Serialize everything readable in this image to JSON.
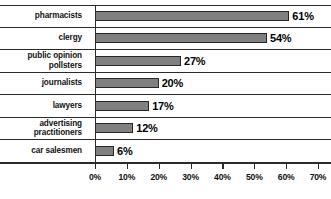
{
  "chart_data": {
    "type": "bar",
    "orientation": "horizontal",
    "title": "",
    "subtitle": "",
    "xlabel": "",
    "ylabel": "",
    "xlim": [
      0,
      70
    ],
    "xtick_labels": [
      "0%",
      "10%",
      "20%",
      "30%",
      "40%",
      "50%",
      "60%",
      "70%"
    ],
    "xticks": [
      0,
      10,
      20,
      30,
      40,
      50,
      60,
      70
    ],
    "grid": false,
    "legend": null,
    "categories": [
      "pharmacists",
      "clergy",
      "public opinion pollsters",
      "journalists",
      "lawyers",
      "advertising practitioners",
      "car salesmen"
    ],
    "values": [
      61,
      54,
      27,
      20,
      17,
      12,
      6
    ],
    "data_labels": [
      "61%",
      "54%",
      "27%",
      "20%",
      "17%",
      "12%",
      "6%"
    ],
    "bar_color": "#808080",
    "bar_border_color": "#262626",
    "axis_color": "#2b2b2b",
    "text_color": "#111111"
  },
  "rows": [
    {
      "label_lines": [
        "pharmacists"
      ],
      "value": 61,
      "value_label": "61%"
    },
    {
      "label_lines": [
        "clergy"
      ],
      "value": 54,
      "value_label": "54%"
    },
    {
      "label_lines": [
        "public opinion",
        "pollsters"
      ],
      "value": 27,
      "value_label": "27%"
    },
    {
      "label_lines": [
        "journalists"
      ],
      "value": 20,
      "value_label": "20%"
    },
    {
      "label_lines": [
        "lawyers"
      ],
      "value": 17,
      "value_label": "17%"
    },
    {
      "label_lines": [
        "advertising",
        "practitioners"
      ],
      "value": 12,
      "value_label": "12%"
    },
    {
      "label_lines": [
        "car salesmen"
      ],
      "value": 6,
      "value_label": "6%"
    }
  ]
}
